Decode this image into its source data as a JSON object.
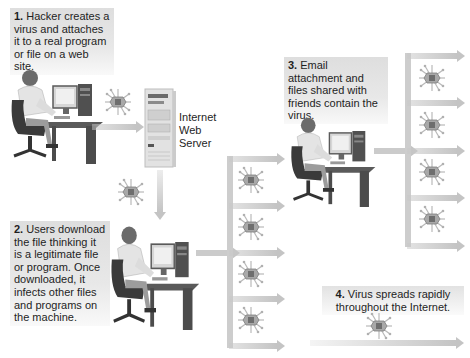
{
  "diagram": {
    "steps": [
      {
        "number": "1.",
        "text": "Hacker creates a virus and attaches it to a real program or file on a web site."
      },
      {
        "number": "2.",
        "text": "Users download the file thinking it is a legitimate file or program. Once downloaded, it infects other files and programs on the machine."
      },
      {
        "number": "3.",
        "text": "Email attachment and files shared with friends contain the virus."
      },
      {
        "number": "4.",
        "text": "Virus spreads rapidly throughout the Internet."
      }
    ],
    "server_label": "Internet Web Server",
    "icons": {
      "person": "person-at-computer-icon",
      "server": "server-tower-icon",
      "virus": "virus-icon",
      "arrow": "arrow-icon"
    },
    "colors": {
      "callout_bg": "#e0e0e0",
      "arrow": "#c4c4c4",
      "virus_body": "#8a8a8a",
      "text": "#1e1e1e"
    }
  }
}
